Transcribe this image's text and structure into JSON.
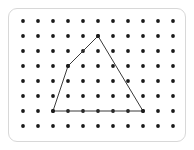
{
  "figure": {
    "kind": "geoboard-dot-grid-with-polygon",
    "frame": {
      "x": 8,
      "y": 8,
      "width": 178,
      "height": 134,
      "corner_radius": 9,
      "border_color": "#d8d8d8",
      "background_color": "#ffffff"
    },
    "grid": {
      "columns": 11,
      "rows": 8,
      "origin_x": 23,
      "origin_y": 21,
      "spacing_x": 15,
      "spacing_y": 15,
      "dot_radius": 1.9,
      "dot_color": "#1a1a1a"
    },
    "polygon": {
      "name": "triangle",
      "closed": true,
      "stroke_color": "#3a3a3a",
      "stroke_width": 1,
      "vertex_count": 4,
      "vertices": [
        {
          "label": "apex",
          "grid_col": 5,
          "grid_row": 1,
          "x": 98,
          "y": 36
        },
        {
          "label": "left-bend",
          "grid_col": 3,
          "grid_row": 3,
          "x": 68,
          "y": 66
        },
        {
          "label": "bottom-left",
          "grid_col": 2,
          "grid_row": 6,
          "x": 53,
          "y": 111
        },
        {
          "label": "bottom-right",
          "grid_col": 8,
          "grid_row": 6,
          "x": 143,
          "y": 111
        }
      ],
      "edges": [
        {
          "from": "apex",
          "to": "left-bend"
        },
        {
          "from": "left-bend",
          "to": "bottom-left"
        },
        {
          "from": "bottom-left",
          "to": "bottom-right"
        },
        {
          "from": "bottom-right",
          "to": "apex"
        }
      ]
    }
  }
}
